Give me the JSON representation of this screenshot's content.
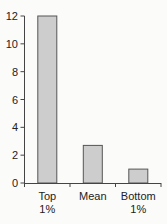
{
  "chart_data": {
    "type": "bar",
    "title": "",
    "xlabel": "",
    "ylabel": "",
    "categories": [
      "Top 1%",
      "Mean",
      "Bottom 1%"
    ],
    "category_lines": [
      [
        "Top",
        "1%"
      ],
      [
        "Mean"
      ],
      [
        "Bottom",
        "1%"
      ]
    ],
    "values": [
      12,
      2.7,
      1.0
    ],
    "ylim": [
      0,
      12
    ],
    "yticks": [
      0,
      2,
      4,
      6,
      8,
      10,
      12
    ],
    "grid": false,
    "legend": null,
    "colors": {
      "bar_fill": "#cdcdcd",
      "bar_stroke": "#555555",
      "axis": "#444444",
      "background": "#fbfbfa"
    }
  }
}
